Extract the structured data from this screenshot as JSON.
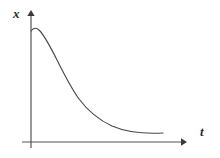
{
  "figure": {
    "background_color": "#ffffff",
    "line_color": "#4a4a4a",
    "axis_color": "#555555",
    "label_color": "#2b2b2b"
  },
  "axes": {
    "y_axis": {
      "label": "x",
      "icon": "arrow-up-icon",
      "origin_x": 31,
      "top_y": 11,
      "bottom_y": 148
    },
    "x_axis": {
      "label": "t",
      "icon": "arrow-right-icon",
      "baseline_y": 142,
      "left_x": 22,
      "tip_x": 185
    }
  },
  "chart_data": {
    "type": "line",
    "title": "",
    "subtitle": "",
    "xlabel": "t",
    "ylabel": "x",
    "grid": false,
    "legend": null,
    "annotations": [],
    "xlim": [
      0,
      1
    ],
    "ylim": [
      0,
      1
    ],
    "x_tick_labels": [],
    "y_tick_labels": [],
    "series": [
      {
        "name": "decay",
        "x": [
          0.0,
          0.04,
          0.08,
          0.12,
          0.16,
          0.2,
          0.25,
          0.3,
          0.35,
          0.4,
          0.45,
          0.5,
          0.55,
          0.6,
          0.65,
          0.7,
          0.75,
          0.8,
          0.85,
          0.9,
          0.95,
          1.0
        ],
        "y": [
          0.915,
          0.94,
          0.935,
          0.905,
          0.855,
          0.79,
          0.7,
          0.61,
          0.528,
          0.455,
          0.392,
          0.337,
          0.29,
          0.248,
          0.212,
          0.181,
          0.154,
          0.131,
          0.112,
          0.097,
          0.086,
          0.08
        ]
      }
    ],
    "svg_path": "M 31,31 C 33.5,27.6 36.5,27.3 39.5,30.5 C 45,36.4 51,48 57,60 C 64,74 71,88 79,99 C 88,111 99,120 112,126 C 126,132 145,134 163,133"
  }
}
